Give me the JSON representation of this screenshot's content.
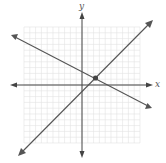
{
  "chart_data": {
    "type": "line",
    "title": "",
    "xlabel": "x",
    "ylabel": "y",
    "xlim": [
      -10,
      10
    ],
    "ylim": [
      -10,
      10
    ],
    "grid": true,
    "tick_labels": false,
    "series": [
      {
        "name": "increasing line",
        "slope": 1.2,
        "points": [
          [
            -11,
            -11.5
          ],
          [
            12,
            10.9
          ]
        ],
        "arrows": "both"
      },
      {
        "name": "decreasing line",
        "slope": -0.6,
        "points": [
          [
            -12,
            8.6
          ],
          [
            12,
            -3.8
          ]
        ],
        "arrows": "both"
      }
    ],
    "intersection": {
      "x": 2.4,
      "y": 1.2,
      "marked": true
    },
    "colors": {
      "grid": "#e2e2e2",
      "axes": "#444444",
      "lines": "#555555",
      "point": "#444444"
    }
  },
  "labels": {
    "x_axis": "x",
    "y_axis": "y"
  }
}
